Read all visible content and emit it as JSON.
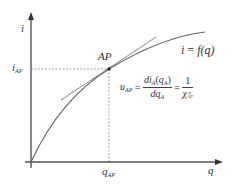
{
  "diagram": {
    "colors": {
      "axis": "#555555",
      "curve": "#666666",
      "tangent": "#777777",
      "dashed": "#888888",
      "point": "#333333",
      "text": "#333333"
    },
    "axes": {
      "y_label": "i",
      "x_label": "q"
    },
    "point": {
      "label": "AP"
    },
    "ticks": {
      "y_tick_main": "i",
      "y_tick_sub": "AP",
      "x_tick_main": "q",
      "x_tick_sub": "AP"
    },
    "curve_label": {
      "lhs": "i",
      "eq": "=",
      "fn": "f",
      "arg": "(q)"
    },
    "formula": {
      "lhs_main": "u",
      "lhs_sub": "AP",
      "eq1": "=",
      "num_d": "d",
      "num_i": "i",
      "num_i_sub": "A",
      "num_paren_open": "(",
      "num_q": "q",
      "num_q_sub": "A",
      "num_paren_close": ")",
      "den_d": "d",
      "den_q": "q",
      "den_q_sub": "A",
      "eq2": "=",
      "rhs_num": "1",
      "rhs_den_main": "χ",
      "rhs_den_sup": "ψ",
      "rhs_den_sub": "AP"
    }
  }
}
